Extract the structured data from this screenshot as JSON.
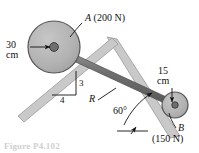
{
  "figure": {
    "caption": "Figure P4.102",
    "bodies": [
      {
        "name": "cylinder-a",
        "label": "A",
        "weight_label": "(200 N)",
        "radius_label": "30",
        "radius_unit": "cm",
        "radius_cm": 30,
        "weight_n": 200
      },
      {
        "name": "cylinder-b",
        "label": "B",
        "weight_label": "(150 N)",
        "radius_label": "15",
        "radius_unit": "cm",
        "radius_cm": 15,
        "weight_n": 150
      }
    ],
    "connector": {
      "label": "R",
      "name": "rod-r"
    },
    "slopes": {
      "left_rise": "3",
      "left_run": "4",
      "right_angle": "60°"
    },
    "colors": {
      "cylinder_fill": "#b3b3b3",
      "cylinder_stroke": "#4d4d4d",
      "plane_fill": "#c9c9c9",
      "plane_stroke": "#8c8c8c",
      "rod_fill": "#787878",
      "ink": "#111111"
    }
  }
}
